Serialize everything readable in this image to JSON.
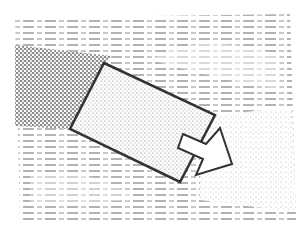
{
  "figure": {
    "width": 299,
    "height": 239,
    "background": "#ffffff",
    "ink": "#333333",
    "elements": {
      "dash_field": {
        "color": "#8a8a8a",
        "row_spacing": 6
      },
      "dark_band": {
        "polygon": "15,45 110,58 104,63 70,129 15,126",
        "fill_pattern": "dense-stipple"
      },
      "light_area": {
        "polygon": "200,120 290,95 296,210 200,200",
        "fill_pattern": "sparse-stipple"
      },
      "rectangle": {
        "points": "104,63 215,115 180,182 70,129",
        "stroke": "#333333",
        "stroke_width": 2.5
      },
      "arrow": {
        "points": "183,134 206,144 220,128 232,164 196,175 203,159 178,148",
        "stroke": "#333333",
        "stroke_width": 2,
        "fill": "#ffffff"
      }
    }
  }
}
